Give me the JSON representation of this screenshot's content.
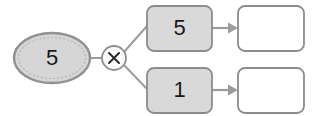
{
  "diagram": {
    "type": "number-bond-multiplication",
    "background_color": "#ffffff",
    "source": {
      "shape": "ellipse",
      "value": "5",
      "fill_color": "#d6d6d6",
      "border_color": "#919191",
      "name": "source-value"
    },
    "operator": {
      "shape": "circle",
      "symbol": "multiply",
      "glyph": "×",
      "fill_color": "#fcfcfc",
      "border_color": "#8f8f8f"
    },
    "factors": [
      {
        "value": "5",
        "fill_color": "#d9d9d9",
        "border_color": "#8c8c8c",
        "position": "top"
      },
      {
        "value": "1",
        "fill_color": "#d9d9d9",
        "border_color": "#8c8c8c",
        "position": "bottom"
      }
    ],
    "results": [
      {
        "value": "",
        "fill_color": "#ffffff",
        "border_color": "#8c8c8c",
        "position": "top",
        "state": "empty"
      },
      {
        "value": "",
        "fill_color": "#ffffff",
        "border_color": "#8c8c8c",
        "position": "bottom",
        "state": "empty"
      }
    ],
    "connectors": {
      "stroke_color": "#9c9c9c",
      "arrow_color": "#9c9c9c"
    }
  }
}
